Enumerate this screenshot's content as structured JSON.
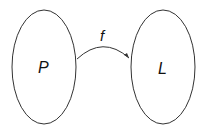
{
  "diagram": {
    "sets": [
      {
        "id": "P",
        "label": "P",
        "cx": 44,
        "cy": 67,
        "rx": 33,
        "ry": 57
      },
      {
        "id": "L",
        "label": "L",
        "cx": 163,
        "cy": 67,
        "rx": 33,
        "ry": 57
      }
    ],
    "mapping": {
      "label": "f",
      "from": "P",
      "to": "L"
    },
    "colors": {
      "stroke": "#333333",
      "background": "#ffffff"
    }
  }
}
